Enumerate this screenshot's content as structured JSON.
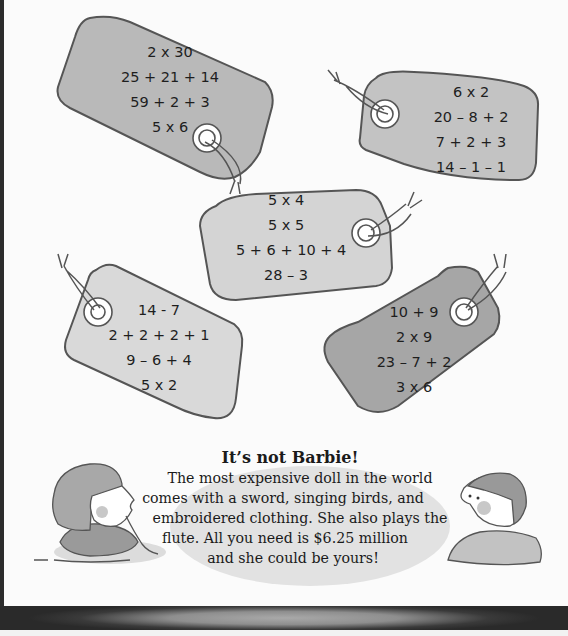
{
  "tags": [
    {
      "id": "tag-1",
      "fill": "#b9b9b9",
      "expressions": [
        "2 x 30",
        "25 + 21 + 14",
        "59 + 2 + 3",
        "5 x 6"
      ]
    },
    {
      "id": "tag-2",
      "fill": "#c3c3c3",
      "expressions": [
        "6 x 2",
        "20 – 8 + 2",
        "7 + 2 + 3",
        "14 – 1 – 1"
      ]
    },
    {
      "id": "tag-3",
      "fill": "#d4d4d4",
      "expressions": [
        "5 x 4",
        "5 x 5",
        "5 + 6 + 10 + 4",
        "28 – 3"
      ]
    },
    {
      "id": "tag-4",
      "fill": "#d9d9d9",
      "expressions": [
        "14 - 7",
        "2 + 2 + 2 + 1",
        "9 – 6 + 4",
        "5 x 2"
      ]
    },
    {
      "id": "tag-5",
      "fill": "#a6a6a6",
      "expressions": [
        "10 + 9",
        "2 x 9",
        "23 – 7 + 2",
        "3 x 6"
      ]
    }
  ],
  "fact": {
    "title": "It’s not Barbie!",
    "lines": [
      "The most expensive doll in the world",
      "comes with a sword, singing birds, and",
      "embroidered clothing. She also plays the",
      "flute. All you need is $6.25 million",
      "and she could be yours!"
    ]
  },
  "illustrations": {
    "left": "girl-thinking-illustration",
    "right": "boy-looking-up-illustration"
  }
}
